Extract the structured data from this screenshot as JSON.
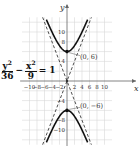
{
  "chart_data": {
    "type": "line",
    "title": "",
    "equation": {
      "num1": "y",
      "den1": "36",
      "op": "−",
      "num2": "x",
      "den2": "9",
      "eq": "= 1"
    },
    "xlabel": "x",
    "ylabel": "y",
    "xlim": [
      -12,
      12
    ],
    "ylim": [
      -12,
      12
    ],
    "x_tick_labels": [
      "−10",
      "−8",
      "−6",
      "−4",
      "−2",
      "2",
      "4",
      "6",
      "8",
      "10"
    ],
    "y_tick_labels": [
      "10",
      "8",
      "4",
      "−4",
      "−8",
      "−10"
    ],
    "grid": true,
    "series": [
      {
        "name": "upper branch",
        "style": "solid",
        "function": "y = 6*sqrt(1 + x^2/9)"
      },
      {
        "name": "lower branch",
        "style": "solid",
        "function": "y = -6*sqrt(1 + x^2/9)"
      },
      {
        "name": "asymptote 1",
        "style": "dashed",
        "function": "y = 2x"
      },
      {
        "name": "asymptote 2",
        "style": "dashed",
        "function": "y = -2x"
      }
    ],
    "points": [
      {
        "x": 0,
        "y": 6,
        "label": "(0, 6)"
      },
      {
        "x": 0,
        "y": -6,
        "label": "(0, −6)"
      }
    ]
  }
}
